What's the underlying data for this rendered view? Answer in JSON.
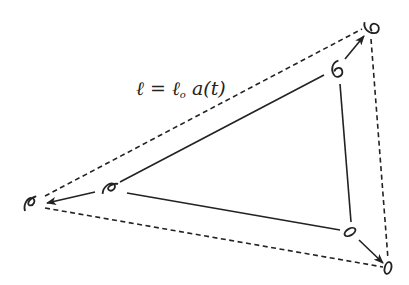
{
  "diagram": {
    "equation": {
      "lhs": "ℓ",
      "eq": " = ",
      "base": "ℓ",
      "subscript": "o",
      "rhs": " a(t)"
    },
    "colors": {
      "stroke": "#222222",
      "background": "#ffffff"
    },
    "inner_triangle": {
      "style": "solid",
      "galaxies": [
        {
          "name": "top-right",
          "glyph": "spiral-6",
          "x": 337,
          "y": 70
        },
        {
          "name": "left",
          "glyph": "spiral-edge",
          "x": 110,
          "y": 188
        },
        {
          "name": "bottom-right",
          "glyph": "ellipse",
          "x": 350,
          "y": 232
        }
      ]
    },
    "outer_triangle": {
      "style": "dashed",
      "galaxies": [
        {
          "name": "top-right",
          "glyph": "spiral-6",
          "x": 372,
          "y": 28
        },
        {
          "name": "left",
          "glyph": "spiral-edge",
          "x": 30,
          "y": 203
        },
        {
          "name": "bottom-right",
          "glyph": "ellipse",
          "x": 388,
          "y": 267
        }
      ]
    },
    "arrows": [
      {
        "from": "inner top-right",
        "to": "outer top-right"
      },
      {
        "from": "inner left",
        "to": "outer left"
      },
      {
        "from": "inner bottom-right",
        "to": "outer bottom-right"
      }
    ]
  }
}
